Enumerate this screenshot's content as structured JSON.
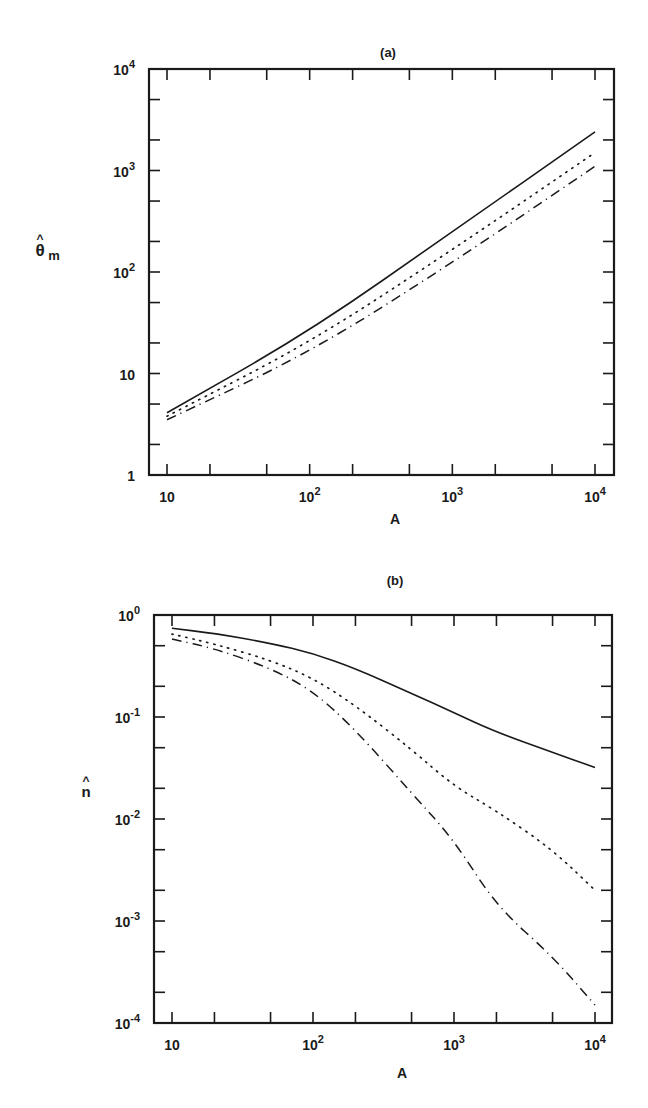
{
  "chart_data": [
    {
      "type": "line",
      "panel": "(a)",
      "title": "(a)",
      "xlabel": "A",
      "ylabel": "θ̂m",
      "xscale": "log",
      "yscale": "log",
      "xlim": [
        10,
        10000
      ],
      "ylim": [
        1,
        10000
      ],
      "grid": false,
      "legend": null,
      "xticks": [
        {
          "base": "10",
          "exp": ""
        },
        {
          "base": "10",
          "exp": "2"
        },
        {
          "base": "10",
          "exp": "3"
        },
        {
          "base": "10",
          "exp": "4"
        }
      ],
      "yticks": [
        {
          "base": "1",
          "exp": ""
        },
        {
          "base": "10",
          "exp": ""
        },
        {
          "base": "10",
          "exp": "2"
        },
        {
          "base": "10",
          "exp": "3"
        },
        {
          "base": "10",
          "exp": "4"
        }
      ],
      "x": [
        10,
        100,
        1000,
        10000
      ],
      "series": [
        {
          "name": "solid",
          "style": "solid",
          "values": [
            4.1,
            26,
            250,
            2400
          ]
        },
        {
          "name": "dotted",
          "style": "dotted",
          "values": [
            3.8,
            20,
            165,
            1500
          ]
        },
        {
          "name": "dash-dot",
          "style": "dash-dot",
          "values": [
            3.5,
            16,
            123,
            1100
          ]
        }
      ]
    },
    {
      "type": "line",
      "panel": "(b)",
      "title": "(b)",
      "xlabel": "A",
      "ylabel": "n̂",
      "xscale": "log",
      "yscale": "log",
      "xlim": [
        10,
        10000
      ],
      "ylim": [
        0.0001,
        1
      ],
      "grid": false,
      "legend": null,
      "xticks": [
        {
          "base": "10",
          "exp": ""
        },
        {
          "base": "10",
          "exp": "2"
        },
        {
          "base": "10",
          "exp": "3"
        },
        {
          "base": "10",
          "exp": "4"
        }
      ],
      "yticks": [
        {
          "base": "10",
          "exp": "-4"
        },
        {
          "base": "10",
          "exp": "-3"
        },
        {
          "base": "10",
          "exp": "-2"
        },
        {
          "base": "10",
          "exp": "-1"
        },
        {
          "base": "10",
          "exp": "0"
        }
      ],
      "x": [
        10,
        20,
        50,
        100,
        200,
        500,
        1000,
        2000,
        5000,
        10000
      ],
      "series": [
        {
          "name": "solid",
          "style": "solid",
          "values": [
            0.74,
            0.66,
            0.53,
            0.42,
            0.3,
            0.17,
            0.11,
            0.071,
            0.045,
            0.032
          ]
        },
        {
          "name": "dotted",
          "style": "dotted",
          "values": [
            0.65,
            0.52,
            0.36,
            0.24,
            0.13,
            0.048,
            0.021,
            0.012,
            0.005,
            0.002
          ]
        },
        {
          "name": "dash-dot",
          "style": "dash-dot",
          "values": [
            0.58,
            0.47,
            0.3,
            0.18,
            0.075,
            0.018,
            0.0062,
            0.0014,
            0.00045,
            0.00015
          ]
        }
      ]
    }
  ],
  "labels": {
    "a_title": "(a)",
    "b_title": "(b)",
    "a_xlabel": "A",
    "b_xlabel": "A",
    "a_ylabel_main": "θ",
    "a_ylabel_hat": "^",
    "a_ylabel_sub": "m",
    "b_ylabel_main": "n",
    "b_ylabel_hat": "^"
  }
}
